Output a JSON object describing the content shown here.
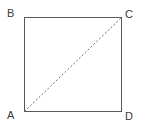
{
  "figure": {
    "kind": "square-with-diagonal",
    "background_color": "#ffffff",
    "width": 145,
    "height": 131,
    "square": {
      "name": "ABCD",
      "stroke_color": "#595959",
      "stroke_width": 1,
      "left": 24,
      "top": 17,
      "right": 122,
      "bottom": 112,
      "side_length_px": 97
    },
    "diagonal": {
      "from": "A",
      "to": "C",
      "style": "dashed",
      "stroke_color": "#6b6b6b",
      "stroke_width": 1,
      "dash_pattern": "2 2",
      "x1": 24,
      "y1": 112,
      "x2": 122,
      "y2": 17
    },
    "vertices": [
      {
        "id": "A",
        "label": "A",
        "position": "bottom-left",
        "x": 24,
        "y": 112
      },
      {
        "id": "B",
        "label": "B",
        "position": "top-left",
        "x": 24,
        "y": 17
      },
      {
        "id": "C",
        "label": "C",
        "position": "top-right",
        "x": 122,
        "y": 17
      },
      {
        "id": "D",
        "label": "D",
        "position": "bottom-right",
        "x": 122,
        "y": 112
      }
    ],
    "label_color": "#3a3a3a",
    "label_font_size_px": 11
  }
}
